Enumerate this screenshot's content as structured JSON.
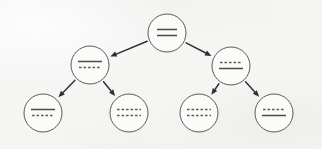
{
  "diagram": {
    "canvas": {
      "width": 322,
      "height": 149
    },
    "colors": {
      "background": "#f5f5f4",
      "node_fill": "#fbfbfa",
      "node_stroke": "#5a5a5a",
      "glyph": "#4a4a4a",
      "edge": "#2f2f2f"
    },
    "node_radius": 19,
    "nodes": [
      {
        "id": "root",
        "label": "root-node",
        "cx": 167,
        "cy": 33,
        "glyphs": [
          {
            "style": "solid",
            "width": 20,
            "dy": -3.5
          },
          {
            "style": "solid",
            "width": 20,
            "dy": 2.5
          }
        ]
      },
      {
        "id": "n-left",
        "label": "left-branch-node",
        "cx": 90,
        "cy": 65,
        "glyphs": [
          {
            "style": "solid",
            "width": 24,
            "dy": -3.5
          },
          {
            "style": "dashed",
            "width": 22,
            "dy": 2.5
          }
        ]
      },
      {
        "id": "n-right",
        "label": "right-branch-node",
        "cx": 231,
        "cy": 66,
        "glyphs": [
          {
            "style": "dashed",
            "width": 22,
            "dy": -3.5
          },
          {
            "style": "solid",
            "width": 24,
            "dy": 2.5
          }
        ]
      },
      {
        "id": "leaf-1",
        "label": "leaf-node-1",
        "cx": 43,
        "cy": 113,
        "glyphs": [
          {
            "style": "solid",
            "width": 24,
            "dy": -3.5
          },
          {
            "style": "dashed",
            "width": 22,
            "dy": 2.5
          }
        ]
      },
      {
        "id": "leaf-2",
        "label": "leaf-node-2",
        "cx": 129,
        "cy": 113,
        "glyphs": [
          {
            "style": "dashed",
            "width": 24,
            "dy": -3.5
          },
          {
            "style": "dashed",
            "width": 24,
            "dy": 2.5
          }
        ]
      },
      {
        "id": "leaf-3",
        "label": "leaf-node-3",
        "cx": 199,
        "cy": 113,
        "glyphs": [
          {
            "style": "dashed",
            "width": 24,
            "dy": -3.5
          },
          {
            "style": "dashed",
            "width": 24,
            "dy": 2.5
          }
        ]
      },
      {
        "id": "leaf-4",
        "label": "leaf-node-4",
        "cx": 274,
        "cy": 113,
        "glyphs": [
          {
            "style": "dashed",
            "width": 22,
            "dy": -3.5
          },
          {
            "style": "solid",
            "width": 24,
            "dy": 2.5
          }
        ]
      }
    ],
    "edges": [
      {
        "id": "edge-root-left",
        "label": "arrow-root-to-left-branch",
        "from": "root",
        "to": "n-left"
      },
      {
        "id": "edge-root-right",
        "label": "arrow-root-to-right-branch",
        "from": "root",
        "to": "n-right"
      },
      {
        "id": "edge-left-leaf1",
        "label": "arrow-left-branch-to-leaf-1",
        "from": "n-left",
        "to": "leaf-1"
      },
      {
        "id": "edge-left-leaf2",
        "label": "arrow-left-branch-to-leaf-2",
        "from": "n-left",
        "to": "leaf-2"
      },
      {
        "id": "edge-right-leaf3",
        "label": "arrow-right-branch-to-leaf-3",
        "from": "n-right",
        "to": "leaf-3"
      },
      {
        "id": "edge-right-leaf4",
        "label": "arrow-right-branch-to-leaf-4",
        "from": "n-right",
        "to": "leaf-4"
      }
    ]
  }
}
